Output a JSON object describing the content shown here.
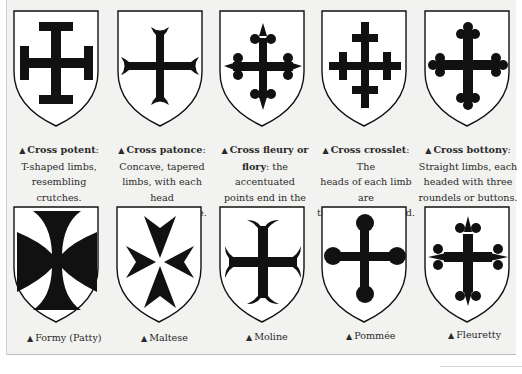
{
  "top_row": [
    {
      "name": "Cross potent",
      "desc_lines": [
        "T-shaped limbs,",
        "resembling crutches."
      ],
      "title_line_suffix": ":"
    },
    {
      "name": "Cross patonce",
      "desc_lines": [
        "Concave, tapered",
        "limbs, with each head",
        "divided into three."
      ],
      "title_line_suffix": ":"
    },
    {
      "name": "Cross fleury or",
      "name2": "flory",
      "desc_first": ": the accentuated",
      "desc_lines": [
        "points end in the form",
        "of a fleur de lis."
      ]
    },
    {
      "name": "Cross crosslet",
      "desc_first": ": The",
      "desc_lines": [
        "heads of each limb are",
        "themselves crossed."
      ]
    },
    {
      "name": "Cross bottony",
      "desc_lines": [
        "Straight limbs, each",
        "headed with three",
        "roundels or buttons."
      ],
      "title_line_suffix": ":"
    }
  ],
  "bottom_row": [
    {
      "label": "Formy (Patty)"
    },
    {
      "label": "Maltese"
    },
    {
      "label": "Moline"
    },
    {
      "label": "Pommée"
    },
    {
      "label": "Fleuretty"
    }
  ],
  "marker": "▲",
  "colors": {
    "panel_bg": "#f2f2f0",
    "shield_fill": "#ffffff",
    "charge": "#111111"
  }
}
